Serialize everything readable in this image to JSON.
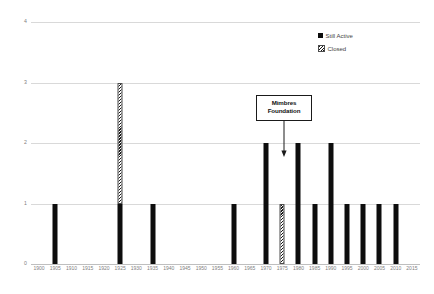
{
  "chart_data": {
    "type": "bar",
    "title": "",
    "subtitle": "",
    "xlabel": "",
    "ylabel": "",
    "stacked": true,
    "grid": true,
    "legend_position": "top-right",
    "xlim": [
      1900,
      2015
    ],
    "ylim": [
      0,
      4
    ],
    "x_tick_step": 5,
    "y_ticks": [
      "4",
      "3",
      "2",
      "1",
      "0"
    ],
    "y_tick_values": [
      4,
      3,
      2,
      1,
      0
    ],
    "categories": [
      "1900",
      "1905",
      "1910",
      "1915",
      "1920",
      "1925",
      "1930",
      "1935",
      "1940",
      "1945",
      "1950",
      "1955",
      "1960",
      "1965",
      "1970",
      "1975",
      "1980",
      "1985",
      "1990",
      "1995",
      "2000",
      "2005",
      "2010",
      "2015"
    ],
    "series": [
      {
        "name": "Still Active",
        "color": "#0d0d0d",
        "pattern": "solid",
        "values": [
          0,
          1,
          0,
          0,
          0,
          1,
          0,
          1,
          0,
          0,
          0,
          0,
          1,
          0,
          2,
          0,
          2,
          1,
          2,
          1,
          1,
          1,
          1,
          0
        ]
      },
      {
        "name": "Closed",
        "color": "#ffffff",
        "pattern": "diagonal-hatch",
        "values": [
          0,
          0,
          0,
          0,
          0,
          2,
          0,
          0,
          0,
          0,
          0,
          0,
          0,
          0,
          0,
          1,
          0,
          0,
          0,
          0,
          0,
          0,
          0,
          0
        ]
      }
    ],
    "annotations": [
      {
        "label_line_1": "Mimbres",
        "label_line_2": "Foundation",
        "points_to_category": "1977",
        "arrow_direction": "down"
      }
    ]
  },
  "legend": {
    "items": [
      {
        "label": "Still Active",
        "marker": "filled-square-icon"
      },
      {
        "label": "Closed",
        "marker": "hatched-square-icon"
      }
    ]
  },
  "annotation": {
    "line1": "Mimbres",
    "line2": "Foundation"
  }
}
